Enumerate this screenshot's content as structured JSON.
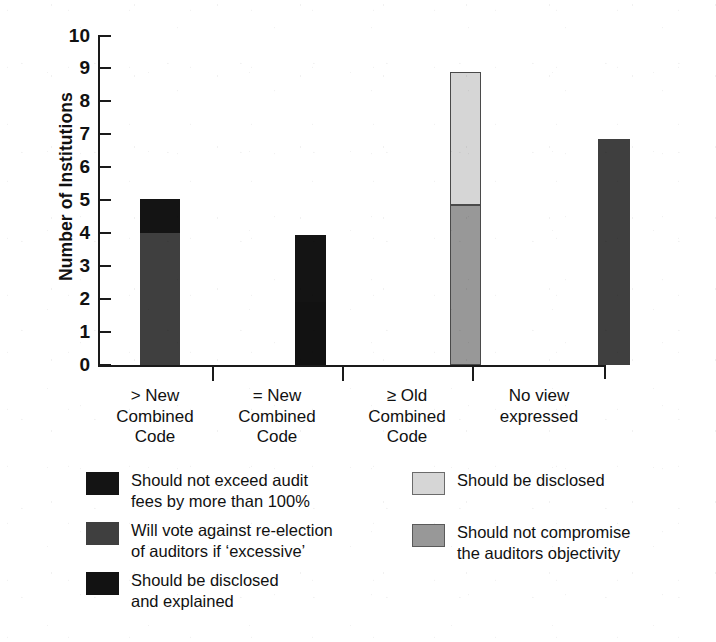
{
  "chart_data": {
    "type": "bar",
    "stacked": true,
    "title": "",
    "xlabel": "",
    "ylabel": "Number of Institutions",
    "ylim": [
      0,
      10
    ],
    "ytick_labels": [
      "10",
      "9",
      "8",
      "7",
      "6",
      "5",
      "4",
      "3",
      "2",
      "1",
      "0"
    ],
    "ytick_values": [
      10,
      9,
      8,
      7,
      6,
      5,
      4,
      3,
      2,
      1,
      0
    ],
    "grid": false,
    "legend_position": "below-axes-two-columns",
    "categories": [
      "> New\nCombined\nCode",
      "= New\nCombined\nCode",
      "≥ Old\nCombined\nCode",
      "No view\nexpressed"
    ],
    "series": [
      {
        "name": "Will vote against re-election of auditors if 'excessive'",
        "color": "#3f3f3f",
        "values": [
          4.0,
          0,
          0,
          6.85
        ]
      },
      {
        "name": "Should not exceed audit fees by more than 100%",
        "color": "#141414",
        "values": [
          1.05,
          2.05,
          0,
          0
        ]
      },
      {
        "name": "Should be disclosed and explained",
        "color": "#121212",
        "values": [
          0,
          1.9,
          0,
          0
        ]
      },
      {
        "name": "Should not compromise the auditors objectivity",
        "color": "#989898",
        "values": [
          0,
          0,
          4.85,
          0
        ]
      },
      {
        "name": "Should be disclosed",
        "color": "#d6d6d6",
        "values": [
          0,
          0,
          4.05,
          0
        ]
      }
    ],
    "totals": [
      5.05,
      3.95,
      8.9,
      6.85
    ],
    "bars": [
      {
        "category": "> New Combined Code",
        "segments": [
          {
            "label": "Will vote against re-election of auditors if 'excessive'",
            "from": 0,
            "to": 4.0,
            "color": "#3f3f3f"
          },
          {
            "label": "Should not exceed audit fees by more than 100%",
            "from": 4.0,
            "to": 5.05,
            "color": "#141414"
          }
        ]
      },
      {
        "category": "= New Combined Code",
        "segments": [
          {
            "label": "Should be disclosed and explained",
            "from": 0,
            "to": 1.9,
            "color": "#121212"
          },
          {
            "label": "Should not exceed audit fees by more than 100%",
            "from": 1.9,
            "to": 3.95,
            "color": "#141414"
          }
        ]
      },
      {
        "category": "≥ Old Combined Code",
        "segments": [
          {
            "label": "Should not compromise the auditors objectivity",
            "from": 0,
            "to": 4.85,
            "color": "#989898"
          },
          {
            "label": "Should be disclosed",
            "from": 4.85,
            "to": 8.9,
            "color": "#d6d6d6"
          }
        ]
      },
      {
        "category": "No view expressed",
        "segments": [
          {
            "label": "Will vote against re-election of auditors if 'excessive'",
            "from": 0,
            "to": 6.85,
            "color": "#3f3f3f"
          }
        ]
      }
    ]
  },
  "axis": {
    "y_title": "Number of Institutions",
    "ticks": [
      "10",
      "9",
      "8",
      "7",
      "6",
      "5",
      "4",
      "3",
      "2",
      "1",
      "0"
    ],
    "categories": [
      {
        "line1": "> New",
        "line2": "Combined",
        "line3": "Code",
        "full": "> New\nCombined\nCode"
      },
      {
        "line1": "= New",
        "line2": "Combined",
        "line3": "Code",
        "full": "= New\nCombined\nCode"
      },
      {
        "line1": "≥ Old",
        "line2": "Combined",
        "line3": "Code",
        "full": "≥ Old\nCombined\nCode"
      },
      {
        "line1": "No view",
        "line2": "expressed",
        "line3": "",
        "full": "No view\nexpressed"
      }
    ]
  },
  "legend": {
    "left_column": [
      {
        "label": "Should not exceed audit\nfees by more than 100%",
        "color": "#141414",
        "border": "#141414"
      },
      {
        "label": "Will vote against re-election\nof auditors if ‘excessive’",
        "color": "#3f3f3f",
        "border": "#3f3f3f"
      },
      {
        "label": "Should be disclosed\nand explained",
        "color": "#121212",
        "border": "#121212"
      }
    ],
    "right_column": [
      {
        "label": "Should be disclosed",
        "color": "#d6d6d6",
        "border": "#6b6b6b"
      },
      {
        "label": "Should not compromise\nthe auditors objectivity",
        "color": "#989898",
        "border": "#5a5a5a"
      }
    ]
  },
  "colors": {
    "black_segment": "#141414",
    "dark_gray_segment": "#3f3f3f",
    "mid_gray_segment": "#989898",
    "light_gray_segment": "#d6d6d6",
    "axis": "#1a1a1a",
    "background": "#ffffff"
  }
}
